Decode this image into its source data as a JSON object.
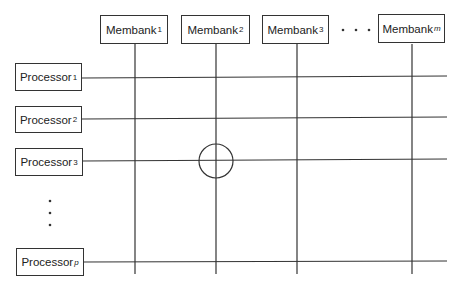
{
  "diagram": {
    "type": "crossbar-switch",
    "membanks": [
      {
        "label": "Membank",
        "sub": "1",
        "x": 100,
        "w": 68,
        "line_x": 135
      },
      {
        "label": "Membank",
        "sub": "2",
        "x": 181,
        "w": 69,
        "line_x": 216
      },
      {
        "label": "Membank",
        "sub": "3",
        "x": 262,
        "w": 67,
        "line_x": 297
      },
      {
        "label": "Membank",
        "sub": "m",
        "x": 378,
        "w": 67,
        "line_x": 412
      }
    ],
    "processors": [
      {
        "label": "Processor",
        "sub": "1",
        "y": 63,
        "line_y": 78
      },
      {
        "label": "Processor",
        "sub": "2",
        "y": 106,
        "line_y": 119
      },
      {
        "label": "Processor",
        "sub": "3",
        "y": 148,
        "line_y": 161
      },
      {
        "label": "Processor",
        "sub": "p",
        "y": 248,
        "line_y": 262
      }
    ],
    "ellipsis_horizontal": "· · ·",
    "ellipsis_vertical": "⋮",
    "switch": {
      "membank_index": 2,
      "processor_index": 3
    }
  }
}
